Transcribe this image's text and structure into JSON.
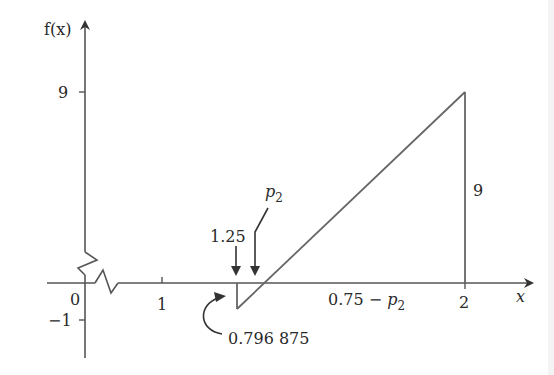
{
  "diagram": {
    "y_axis_label": "f(x)",
    "x_axis_label": "x",
    "y_ticks": [
      {
        "label": "9",
        "value": 9
      },
      {
        "label": "−1",
        "value": -1
      }
    ],
    "x_ticks": [
      {
        "label": "0",
        "value": 0
      },
      {
        "label": "1",
        "value": 1
      },
      {
        "label": "2",
        "value": 2
      }
    ],
    "annotations": {
      "height_label": "9",
      "start_label": "1.25",
      "root_label": "p",
      "root_subscript": "2",
      "min_value_label": "0.796 875",
      "base_label_prefix": "0.75 − ",
      "base_label_var": "p",
      "base_label_sub": "2"
    },
    "shape": {
      "type": "triangle",
      "vertices": [
        [
          1.25,
          -1
        ],
        [
          2,
          9
        ],
        [
          2,
          0
        ]
      ],
      "note": "segment from x=1.25 (f=-1) rising linearly to x=2 (f=9), vertical drop at x=2"
    },
    "axis_breaks": [
      "y-axis",
      "x-axis"
    ],
    "colors": {
      "stroke": "#555555",
      "text": "#2a2a2a"
    }
  }
}
